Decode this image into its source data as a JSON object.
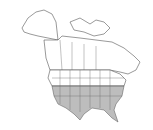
{
  "map": {
    "region": "North America",
    "type": "species range map",
    "range_color": "#bdbdbd",
    "land_color": "#ffffff",
    "border_color": "#555555",
    "shaded_region": "Southern and eastern United States and northern Mexico"
  }
}
